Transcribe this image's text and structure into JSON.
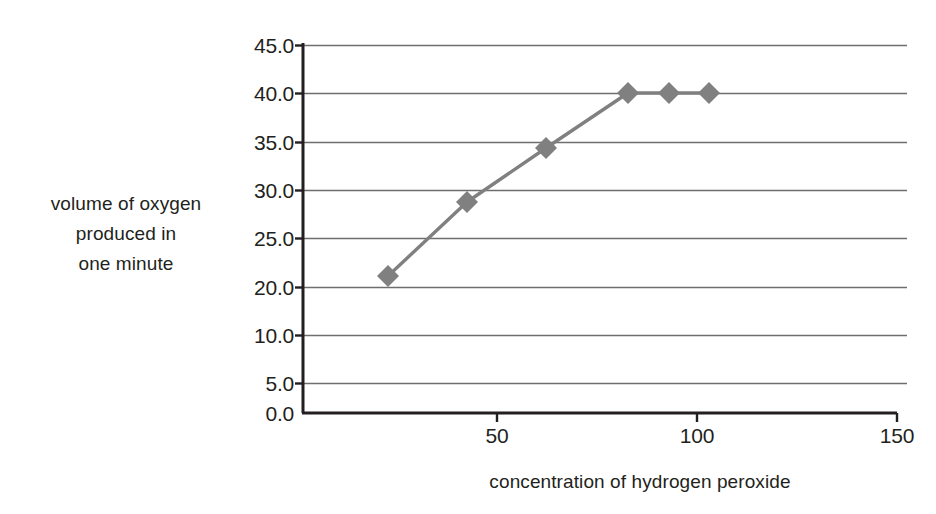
{
  "chart_data": {
    "type": "line",
    "title": "",
    "subtitle": "",
    "xlabel": "concentration of hydrogen peroxide",
    "ylabel": "volume of oxygen produced in one minute",
    "ylabel_lines": [
      "volume of oxygen",
      "produced in",
      "one minute"
    ],
    "grid": true,
    "legend": false,
    "legend_position": "none",
    "xlim": [
      0,
      150
    ],
    "ylim": [
      0,
      45
    ],
    "x_ticks": [
      50,
      100,
      150
    ],
    "x_tick_labels": [
      "50",
      "100",
      "150"
    ],
    "y_ticks": [
      0,
      5,
      10,
      20,
      25,
      30,
      35,
      40,
      45
    ],
    "y_tick_labels": [
      "0.0",
      "5.0",
      "10.0",
      "20.0",
      "25.0",
      "30.0",
      "35.0",
      "40.0",
      "45.0"
    ],
    "series": [
      {
        "name": "volume of oxygen produced",
        "marker": "diamond",
        "color": "#808080",
        "x": [
          24,
          43,
          62,
          82,
          92,
          102
        ],
        "y": [
          20.0,
          27.8,
          33.8,
          39.9,
          39.9,
          39.9
        ]
      }
    ]
  },
  "axis": {
    "x_title": "concentration of hydrogen peroxide",
    "y_title_line1": "volume of oxygen",
    "y_title_line2": "produced in",
    "y_title_line3": "one minute"
  },
  "ticks": {
    "y": [
      {
        "label": "45.0",
        "py": 45
      },
      {
        "label": "40.0",
        "py": 93
      },
      {
        "label": "35.0",
        "py": 142
      },
      {
        "label": "30.0",
        "py": 190
      },
      {
        "label": "25.0",
        "py": 238
      },
      {
        "label": "20.0",
        "py": 287
      },
      {
        "label": "10.0",
        "py": 335
      },
      {
        "label": "5.0",
        "py": 383
      },
      {
        "label": "0.0",
        "py": 413
      }
    ],
    "x": [
      {
        "label": "50",
        "px": 497
      },
      {
        "label": "100",
        "px": 697
      },
      {
        "label": "150",
        "px": 897
      }
    ]
  },
  "points": [
    {
      "px": 388,
      "py": 276,
      "x": 24,
      "y": 20.0
    },
    {
      "px": 467,
      "py": 202,
      "x": 43,
      "y": 27.8
    },
    {
      "px": 546,
      "py": 148,
      "x": 62,
      "y": 33.8
    },
    {
      "px": 628,
      "py": 93,
      "x": 82,
      "y": 39.9
    },
    {
      "px": 669,
      "py": 93,
      "x": 92,
      "y": 39.9
    },
    {
      "px": 709,
      "py": 93,
      "x": 102,
      "y": 39.9
    }
  ],
  "colors": {
    "series": "#808080",
    "axis": "#231f20",
    "grid": "#6d6e71",
    "text": "#231f20",
    "background": "#ffffff"
  },
  "geometry": {
    "plot_left": 303,
    "plot_right": 907,
    "plot_top": 45,
    "plot_bottom": 413
  }
}
